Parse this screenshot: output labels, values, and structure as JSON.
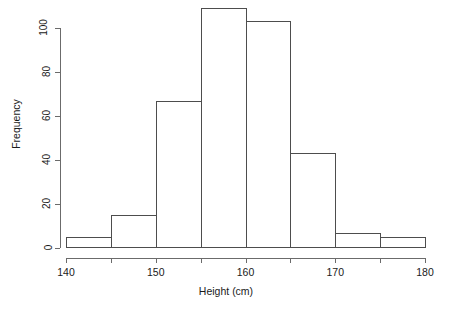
{
  "chart_data": {
    "type": "bar",
    "title": "",
    "subtitle": "",
    "xlabel": "Height (cm)",
    "ylabel": "Frequency",
    "bin_width": 5,
    "bin_edges": [
      140,
      145,
      150,
      155,
      160,
      165,
      170,
      175,
      180
    ],
    "categories": [
      "140-145",
      "145-150",
      "150-155",
      "155-160",
      "160-165",
      "165-170",
      "170-175",
      "175-180"
    ],
    "values": [
      5,
      15,
      67,
      109,
      103,
      43,
      7,
      5
    ],
    "xlim": [
      140,
      180
    ],
    "ylim": [
      0,
      109
    ],
    "x_ticks": [
      140,
      145,
      150,
      155,
      160,
      165,
      170,
      175,
      180
    ],
    "x_tick_labels": [
      "140",
      "",
      "150",
      "",
      "160",
      "",
      "170",
      "",
      "180"
    ],
    "y_ticks": [
      0,
      20,
      40,
      60,
      80,
      100
    ],
    "y_tick_labels": [
      "0",
      "20",
      "40",
      "60",
      "80",
      "100"
    ],
    "grid": false,
    "legend": null,
    "bar_border_color": "#4d4d4d",
    "bar_fill_color": "transparent",
    "axis_color": "#6b6b6b",
    "background_color": "#ffffff"
  },
  "axes": {
    "y_title": "Frequency",
    "x_title": "Height (cm)",
    "y_ticks": [
      {
        "label": "0",
        "value": 0
      },
      {
        "label": "20",
        "value": 20
      },
      {
        "label": "40",
        "value": 40
      },
      {
        "label": "60",
        "value": 60
      },
      {
        "label": "80",
        "value": 80
      },
      {
        "label": "100",
        "value": 100
      }
    ],
    "x_ticks": [
      {
        "label": "140",
        "value": 140
      },
      {
        "label": "",
        "value": 145
      },
      {
        "label": "150",
        "value": 150
      },
      {
        "label": "",
        "value": 155
      },
      {
        "label": "160",
        "value": 160
      },
      {
        "label": "",
        "value": 165
      },
      {
        "label": "170",
        "value": 170
      },
      {
        "label": "",
        "value": 175
      },
      {
        "label": "180",
        "value": 180
      }
    ]
  }
}
